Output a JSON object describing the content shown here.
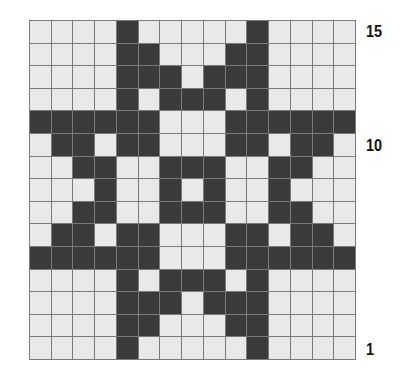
{
  "chart": {
    "rows": 15,
    "cols": 15,
    "colors": {
      "filled": "#3b3b3b",
      "empty": "#e9e9e9",
      "grid": "#7a7a7a"
    },
    "pattern_top_to_bottom": [
      "....X.....X....",
      "....XX...XX....",
      "....XXX.XXX....",
      "....X.XXX.X....",
      "XXXXXX...XXXXXX",
      ".XX.XX...XX.XX.",
      "..XX..XXX..XX..",
      "...X..X.X..X...",
      "..XX..XXX..XX..",
      ".XX.XX...XX.XX.",
      "XXXXXX...XXXXXX",
      "....X.XXX.X....",
      "....XXX.XXX....",
      "....XX...XX....",
      "....X.....X...."
    ]
  },
  "row_labels": [
    {
      "text": "15",
      "row": 15
    },
    {
      "text": "10",
      "row": 10
    },
    {
      "text": "1",
      "row": 1
    }
  ]
}
